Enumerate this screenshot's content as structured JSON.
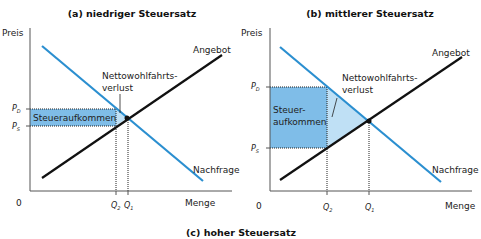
{
  "colors": {
    "demand": "#2b8fd0",
    "supply": "#111111",
    "tax_revenue": "#7fbde8",
    "deadweight_loss": "#bfe0f5",
    "axis": "#555555"
  },
  "panels": [
    {
      "id": "a",
      "title": "(a) niedriger Steuersatz",
      "y_axis_label": "Preis",
      "x_axis_label": "Menge",
      "origin_label": "0",
      "supply_label": "Angebot",
      "demand_label": "Nachfrage",
      "deadweight_label_line1": "Nettowohlfahrts-",
      "deadweight_label_line2": "verlust",
      "revenue_label_line1": "Steueraufkommen",
      "revenue_label_line2": "",
      "price_buyers": {
        "main": "P",
        "sub": "D"
      },
      "price_sellers": {
        "main": "P",
        "sub": "S"
      },
      "quantity_taxed": {
        "main": "Q",
        "sub": "2"
      },
      "quantity_equilibrium": {
        "main": "Q",
        "sub": "1"
      }
    },
    {
      "id": "b",
      "title": "(b) mittlerer Steuersatz",
      "y_axis_label": "Preis",
      "x_axis_label": "Menge",
      "origin_label": "0",
      "supply_label": "Angebot",
      "demand_label": "Nachfrage",
      "deadweight_label_line1": "Nettowohlfahrts-",
      "deadweight_label_line2": "verlust",
      "revenue_label_line1": "Steuer-",
      "revenue_label_line2": "aufkommen",
      "price_buyers": {
        "main": "P",
        "sub": "D"
      },
      "price_sellers": {
        "main": "P",
        "sub": "S"
      },
      "quantity_taxed": {
        "main": "Q",
        "sub": "2"
      },
      "quantity_equilibrium": {
        "main": "Q",
        "sub": "1"
      }
    }
  ],
  "footer_title": "(c) hoher Steuersatz"
}
